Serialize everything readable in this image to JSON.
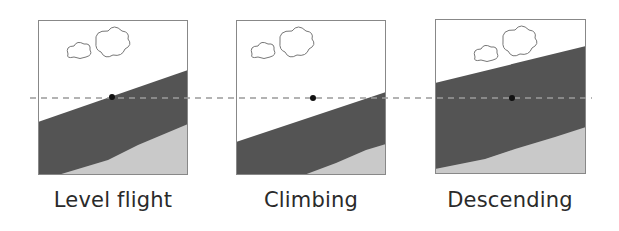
{
  "figure": {
    "horizon_line": "dashed-reference-line",
    "colors": {
      "sky": "#ffffff",
      "dark_band": "#545454",
      "light_ground": "#c9c9c9",
      "frame_border": "#888888",
      "dashed_line": "#9a9a9a",
      "dot": "#111111",
      "caption_text": "#2a2a2a"
    },
    "panels": [
      {
        "label": "Level flight"
      },
      {
        "label": "Climbing"
      },
      {
        "label": "Descending"
      }
    ]
  }
}
